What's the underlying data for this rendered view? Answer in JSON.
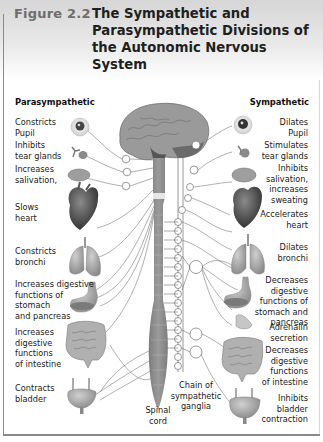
{
  "figure": {
    "number": "Figure 2.2",
    "title": "The Sympathetic and Parasympathetic Divisions of the Autonomic Nervous System"
  },
  "columns": {
    "left_heading": "Parasympathetic",
    "right_heading": "Sympathetic"
  },
  "parasympathetic_effects": [
    {
      "organ": "eye",
      "text": "Constricts\nPupil"
    },
    {
      "organ": "tear-gland",
      "text": "Inhibits\ntear glands"
    },
    {
      "organ": "salivary-gland",
      "text": "Increases\nsalivation,"
    },
    {
      "organ": "heart",
      "text": "Slows\nheart"
    },
    {
      "organ": "lungs",
      "text": "Constricts\nbronchi"
    },
    {
      "organ": "stomach-pancreas",
      "text": "Increases digestive\nfunctions of\nstomach\nand pancreas"
    },
    {
      "organ": "intestine",
      "text": "Increases\ndigestive\nfunctions\nof intestine"
    },
    {
      "organ": "bladder",
      "text": "Contracts\nbladder"
    }
  ],
  "sympathetic_effects": [
    {
      "organ": "eye",
      "text": "Dilates\nPupil"
    },
    {
      "organ": "tear-gland",
      "text": "Stimulates\ntear glands"
    },
    {
      "organ": "salivary-gland",
      "text": "Inhibits\nsalivation,\nincreases\nsweating"
    },
    {
      "organ": "heart",
      "text": "Accelerates\nheart"
    },
    {
      "organ": "lungs",
      "text": "Dilates\nbronchi"
    },
    {
      "organ": "stomach-pancreas",
      "text": "Decreases\ndigestive\nfunctions of\nstomach and\npancreas"
    },
    {
      "organ": "adrenal-gland",
      "text": "Adrenalin\nsecretion"
    },
    {
      "organ": "intestine",
      "text": "Decreases\ndigestive\nfunctions\nof intestine"
    },
    {
      "organ": "bladder",
      "text": "Inhibits\nbladder\ncontraction"
    }
  ],
  "center_labels": {
    "chain": "Chain of\nsympathetic\nganglia",
    "spinal_cord": "Spinal\ncord"
  },
  "colors": {
    "header_gray": "#d6d6d6",
    "figure_number": "#6e6e6e",
    "organ_gray": "#8c8c8c",
    "nerve_line": "#7a7a7a"
  }
}
